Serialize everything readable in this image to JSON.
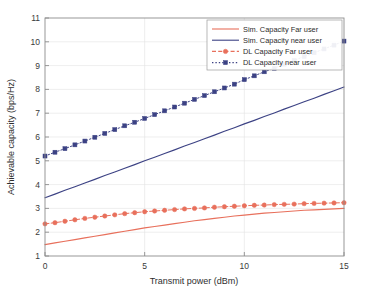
{
  "chart_data": {
    "type": "line",
    "title": "",
    "xlabel": "Transmit power (dBm)",
    "ylabel": "Achievable capacity (bps/Hz)",
    "xlim": [
      0,
      15
    ],
    "ylim": [
      1,
      11
    ],
    "xticks": [
      0,
      5,
      10,
      15
    ],
    "xtick_labels": [
      "0",
      "5",
      "10",
      "15"
    ],
    "yticks": [
      1,
      2,
      3,
      4,
      5,
      6,
      7,
      8,
      9,
      10,
      11
    ],
    "ytick_labels": [
      "1",
      "2",
      "3",
      "4",
      "5",
      "6",
      "7",
      "8",
      "9",
      "10",
      "11"
    ],
    "grid": true,
    "legend_position": "top-right",
    "colors": {
      "far_user": "#E8705C",
      "near_user": "#3C4284",
      "grid": "#E2E2E2",
      "axis": "#8D8D8D",
      "background": "#FFFFFF"
    },
    "x": [
      0,
      0.5,
      1,
      1.5,
      2,
      2.5,
      3,
      3.5,
      4,
      4.5,
      5,
      5.5,
      6,
      6.5,
      7,
      7.5,
      8,
      8.5,
      9,
      9.5,
      10,
      10.5,
      11,
      11.5,
      12,
      12.5,
      13,
      13.5,
      14,
      14.5,
      15
    ],
    "series": [
      {
        "name": "Sim. Capacity Far user",
        "style": "solid",
        "marker": "none",
        "color": "#E8705C",
        "values": [
          1.48,
          1.55,
          1.62,
          1.69,
          1.76,
          1.83,
          1.9,
          1.97,
          2.04,
          2.11,
          2.18,
          2.24,
          2.3,
          2.36,
          2.42,
          2.48,
          2.53,
          2.58,
          2.63,
          2.68,
          2.72,
          2.76,
          2.8,
          2.83,
          2.86,
          2.89,
          2.92,
          2.94,
          2.96,
          2.98,
          3.0
        ]
      },
      {
        "name": "Sim. Capacity near user",
        "style": "solid",
        "marker": "none",
        "color": "#3C4284",
        "values": [
          3.45,
          3.6,
          3.76,
          3.91,
          4.07,
          4.22,
          4.38,
          4.53,
          4.69,
          4.84,
          5.0,
          5.15,
          5.31,
          5.46,
          5.62,
          5.77,
          5.93,
          6.08,
          6.24,
          6.39,
          6.55,
          6.7,
          6.86,
          7.01,
          7.17,
          7.32,
          7.48,
          7.63,
          7.79,
          7.94,
          8.1
        ]
      },
      {
        "name": "DL Capacity Far user",
        "style": "dashed",
        "marker": "circle",
        "color": "#E8705C",
        "values": [
          2.35,
          2.4,
          2.46,
          2.52,
          2.58,
          2.63,
          2.68,
          2.73,
          2.78,
          2.82,
          2.86,
          2.89,
          2.92,
          2.95,
          2.98,
          3.0,
          3.02,
          3.05,
          3.07,
          3.09,
          3.11,
          3.13,
          3.14,
          3.16,
          3.17,
          3.18,
          3.2,
          3.21,
          3.22,
          3.23,
          3.24
        ]
      },
      {
        "name": "DL Capacity near user",
        "style": "dotted",
        "marker": "square",
        "color": "#3C4284",
        "values": [
          5.2,
          5.36,
          5.51,
          5.67,
          5.83,
          5.99,
          6.15,
          6.31,
          6.47,
          6.62,
          6.78,
          6.94,
          7.1,
          7.26,
          7.42,
          7.58,
          7.74,
          7.9,
          8.06,
          8.22,
          8.41,
          8.57,
          8.74,
          8.89,
          9.06,
          9.22,
          9.38,
          9.54,
          9.7,
          9.86,
          10.03
        ]
      }
    ]
  },
  "legend": {
    "entries": [
      {
        "label": "Sim. Capacity Far user",
        "style": "solid",
        "marker": "none",
        "color": "#E8705C"
      },
      {
        "label": "Sim. Capacity near user",
        "style": "solid",
        "marker": "none",
        "color": "#3C4284"
      },
      {
        "label": "DL Capacity Far user",
        "style": "dashed",
        "marker": "circle",
        "color": "#E8705C"
      },
      {
        "label": "DL Capacity near user",
        "style": "dotted",
        "marker": "square",
        "color": "#3C4284"
      }
    ]
  }
}
